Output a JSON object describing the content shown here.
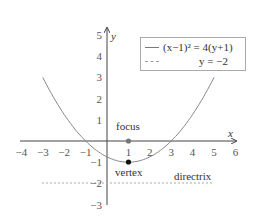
{
  "chart_data": {
    "type": "line",
    "title": "",
    "xlabel": "x",
    "ylabel": "y",
    "xlim": [
      -4,
      6
    ],
    "ylim": [
      -3,
      5
    ],
    "x_ticks": [
      "−4",
      "−3",
      "−2",
      "−1",
      "1",
      "2",
      "3",
      "4",
      "5",
      "6"
    ],
    "y_ticks": [
      "5",
      "4",
      "3",
      "2",
      "1",
      "−1",
      "−2",
      "−3"
    ],
    "grid": false,
    "legend_position": "top-right",
    "series": [
      {
        "name": "(x−1)² = 4(y+1)",
        "style": "solid",
        "color": "#888888",
        "x_range": [
          -3,
          5
        ],
        "equation": "y = (x-1)^2/4 - 1"
      },
      {
        "name": "y = −2",
        "style": "dashed",
        "color": "#aaaaaa",
        "x_range": [
          -3,
          5
        ],
        "equation": "y = -2"
      }
    ],
    "points": [
      {
        "label": "focus",
        "x": 1,
        "y": 0,
        "color": "#777777"
      },
      {
        "label": "vertex",
        "x": 1,
        "y": -1,
        "color": "#111111"
      }
    ],
    "annotations": [
      {
        "text": "focus",
        "x": 1,
        "y": 0.6
      },
      {
        "text": "vertex",
        "x": 1,
        "y": -1.5
      },
      {
        "text": "directrix",
        "x": 4,
        "y": -1.7
      }
    ]
  },
  "legend": {
    "item1": "(x−1)² = 4(y+1)",
    "item2": "y = −2"
  },
  "axes": {
    "x_label": "x",
    "y_label": "y"
  },
  "labels": {
    "focus": "focus",
    "vertex": "vertex",
    "directrix": "directrix"
  }
}
